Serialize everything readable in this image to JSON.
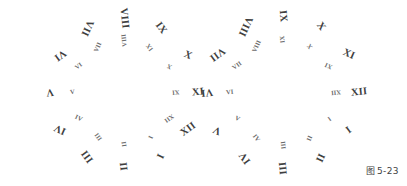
{
  "figure": {
    "caption": "图 5-23",
    "caption_mark": "图",
    "caption_number": "5-23",
    "background_color": "#ffffff",
    "ink_color": "#3f3f3f",
    "inner_ink_color": "#6a6a6a",
    "width": 407,
    "height": 186
  },
  "dials": [
    {
      "name": "left-dial",
      "center_x": 124,
      "center_y": 92,
      "outer_radius": 74,
      "inner_radius": 52,
      "outer_start_angle": 150,
      "inner_start_angle": 150,
      "outer_ring": [
        {
          "label": "I",
          "value": 1,
          "angle": 150,
          "rotation": -66
        },
        {
          "label": "II",
          "value": 2,
          "angle": 180,
          "rotation": -96
        },
        {
          "label": "III",
          "value": 3,
          "angle": 210,
          "rotation": -126
        },
        {
          "label": "IV",
          "value": 4,
          "angle": 240,
          "rotation": -156
        },
        {
          "label": "V",
          "value": 5,
          "angle": 270,
          "rotation": -186
        },
        {
          "label": "VI",
          "value": 6,
          "angle": 300,
          "rotation": -216
        },
        {
          "label": "VII",
          "value": 7,
          "angle": 330,
          "rotation": -246
        },
        {
          "label": "VIII",
          "value": 8,
          "angle": 0,
          "rotation": -276
        },
        {
          "label": "IX",
          "value": 9,
          "angle": 30,
          "rotation": -306
        },
        {
          "label": "X",
          "value": 10,
          "angle": 60,
          "rotation": -336
        },
        {
          "label": "XI",
          "value": 11,
          "angle": 90,
          "rotation": -366
        },
        {
          "label": "XII",
          "value": 12,
          "angle": 120,
          "rotation": -396
        }
      ],
      "inner_ring": [
        {
          "label": "I",
          "value": 1,
          "angle": 150,
          "rotation": 114
        },
        {
          "label": "II",
          "value": 2,
          "angle": 180,
          "rotation": 84
        },
        {
          "label": "III",
          "value": 3,
          "angle": 210,
          "rotation": 54
        },
        {
          "label": "IV",
          "value": 4,
          "angle": 240,
          "rotation": 24
        },
        {
          "label": "V",
          "value": 5,
          "angle": 270,
          "rotation": -6
        },
        {
          "label": "VI",
          "value": 6,
          "angle": 300,
          "rotation": -36
        },
        {
          "label": "VII",
          "value": 7,
          "angle": 330,
          "rotation": -66
        },
        {
          "label": "VIII",
          "value": 8,
          "angle": 0,
          "rotation": -96
        },
        {
          "label": "IX",
          "value": 9,
          "angle": 30,
          "rotation": -126
        },
        {
          "label": "X",
          "value": 10,
          "angle": 60,
          "rotation": -156
        },
        {
          "label": "XI",
          "value": 11,
          "angle": 90,
          "rotation": -186
        },
        {
          "label": "XII",
          "value": 12,
          "angle": 120,
          "rotation": -216
        }
      ]
    },
    {
      "name": "right-dial",
      "center_x": 283,
      "center_y": 92,
      "outer_radius": 76,
      "inner_radius": 53,
      "outer_start_angle": 120,
      "inner_start_angle": 120,
      "outer_ring": [
        {
          "label": "I",
          "value": 1,
          "angle": 120,
          "rotation": -36
        },
        {
          "label": "II",
          "value": 2,
          "angle": 150,
          "rotation": -66
        },
        {
          "label": "III",
          "value": 3,
          "angle": 180,
          "rotation": -96
        },
        {
          "label": "IV",
          "value": 4,
          "angle": 210,
          "rotation": -126
        },
        {
          "label": "V",
          "value": 5,
          "angle": 240,
          "rotation": -156
        },
        {
          "label": "VI",
          "value": 6,
          "angle": 270,
          "rotation": -186
        },
        {
          "label": "VII",
          "value": 7,
          "angle": 300,
          "rotation": -216
        },
        {
          "label": "VIII",
          "value": 8,
          "angle": 330,
          "rotation": -246
        },
        {
          "label": "IX",
          "value": 9,
          "angle": 0,
          "rotation": -276
        },
        {
          "label": "X",
          "value": 10,
          "angle": 30,
          "rotation": -306
        },
        {
          "label": "XI",
          "value": 11,
          "angle": 60,
          "rotation": -336
        },
        {
          "label": "XII",
          "value": 12,
          "angle": 90,
          "rotation": -366
        }
      ],
      "inner_ring": [
        {
          "label": "I",
          "value": 1,
          "angle": 120,
          "rotation": 144
        },
        {
          "label": "II",
          "value": 2,
          "angle": 150,
          "rotation": 114
        },
        {
          "label": "III",
          "value": 3,
          "angle": 180,
          "rotation": 84
        },
        {
          "label": "IV",
          "value": 4,
          "angle": 210,
          "rotation": 54
        },
        {
          "label": "V",
          "value": 5,
          "angle": 240,
          "rotation": 24
        },
        {
          "label": "VI",
          "value": 6,
          "angle": 270,
          "rotation": -6
        },
        {
          "label": "VII",
          "value": 7,
          "angle": 300,
          "rotation": -36
        },
        {
          "label": "VIII",
          "value": 8,
          "angle": 330,
          "rotation": -66
        },
        {
          "label": "IX",
          "value": 9,
          "angle": 0,
          "rotation": -96
        },
        {
          "label": "X",
          "value": 10,
          "angle": 30,
          "rotation": -126
        },
        {
          "label": "XI",
          "value": 11,
          "angle": 60,
          "rotation": -156
        },
        {
          "label": "XII",
          "value": 12,
          "angle": 90,
          "rotation": -186
        }
      ]
    }
  ]
}
